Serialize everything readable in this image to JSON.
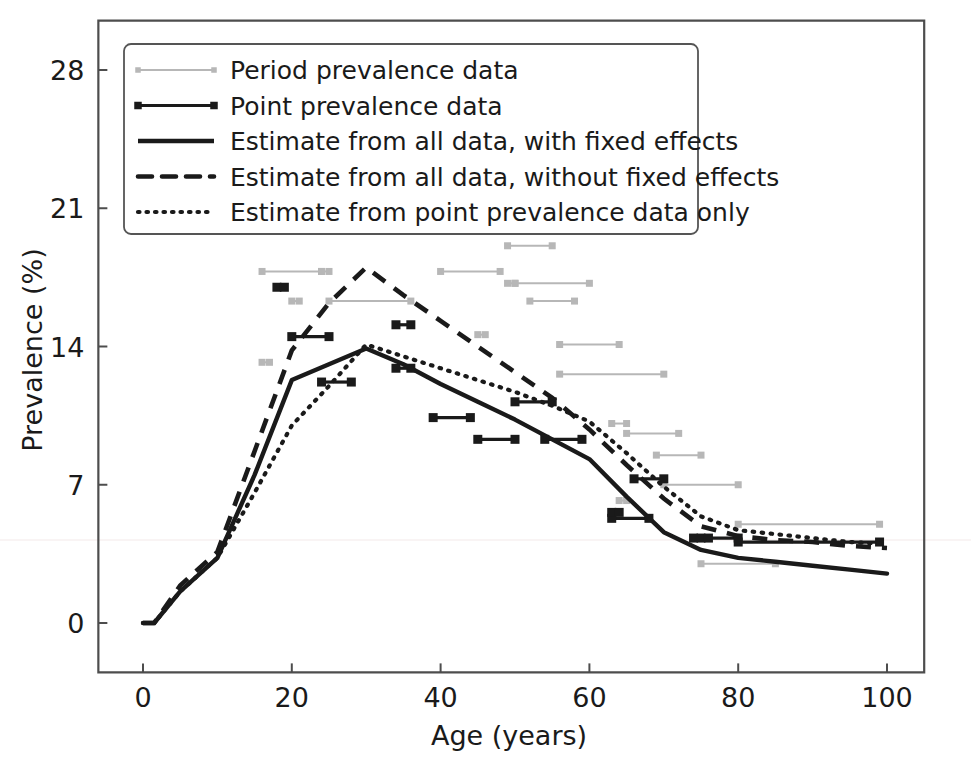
{
  "chart_data": {
    "type": "line",
    "title": "",
    "xlabel": "Age (years)",
    "ylabel": "Prevalence (%)",
    "xlim": [
      -6,
      105
    ],
    "ylim": [
      -2.5,
      30.5
    ],
    "xticks": [
      0,
      20,
      40,
      60,
      80,
      100
    ],
    "yticks": [
      0,
      7,
      14,
      21,
      28
    ],
    "grid": false,
    "legend_position": "upper left",
    "legend_entries": [
      "Period prevalence data",
      "Point prevalence data",
      "Estimate from all data, with fixed effects",
      "Estimate from all data, without fixed effects",
      "Estimate from point prevalence data only"
    ],
    "colors": {
      "estimate": "#1a1a1a",
      "point_data": "#1a1a1a",
      "period_data": "#b7b7b7"
    },
    "series": [
      {
        "name": "Estimate from all data, with fixed effects",
        "style": "solid",
        "x": [
          0,
          1.5,
          5,
          10,
          15,
          20,
          25,
          30,
          35,
          40,
          45,
          50,
          55,
          60,
          65,
          70,
          75,
          80,
          85,
          90,
          95,
          100
        ],
        "y": [
          0.0,
          0.0,
          1.6,
          3.3,
          7.5,
          12.3,
          13.1,
          13.9,
          13.1,
          12.1,
          11.2,
          10.3,
          9.3,
          8.3,
          6.4,
          4.6,
          3.7,
          3.3,
          3.1,
          2.9,
          2.7,
          2.5
        ]
      },
      {
        "name": "Estimate from all data, without fixed effects",
        "style": "dashed",
        "x": [
          0,
          1.5,
          5,
          10,
          15,
          20,
          25,
          30,
          35,
          40,
          45,
          50,
          55,
          60,
          65,
          70,
          75,
          80,
          85,
          90,
          95,
          100
        ],
        "y": [
          0.0,
          0.0,
          1.9,
          3.6,
          8.7,
          13.8,
          16.2,
          18.0,
          16.6,
          15.3,
          14.0,
          12.7,
          11.4,
          9.8,
          8.0,
          6.3,
          4.9,
          4.4,
          4.2,
          4.1,
          3.9,
          3.8
        ]
      },
      {
        "name": "Estimate from point prevalence data only",
        "style": "dotted",
        "x": [
          0,
          1.5,
          5,
          10,
          15,
          20,
          25,
          30,
          35,
          40,
          45,
          50,
          55,
          60,
          65,
          70,
          75,
          80,
          85,
          90,
          95,
          100
        ],
        "y": [
          0.0,
          0.0,
          1.6,
          3.3,
          6.6,
          10.0,
          12.0,
          14.1,
          13.5,
          12.9,
          12.3,
          11.7,
          11.0,
          10.2,
          8.6,
          6.9,
          5.4,
          4.7,
          4.5,
          4.3,
          4.1,
          4.0
        ]
      }
    ],
    "period_prevalence_intervals": [
      {
        "x_start": 16,
        "x_end": 24,
        "y": 17.8
      },
      {
        "x_start": 16,
        "x_end": 17,
        "y": 13.2
      },
      {
        "x_start": 20,
        "x_end": 21,
        "y": 16.3
      },
      {
        "x_start": 24,
        "x_end": 25,
        "y": 17.8
      },
      {
        "x_start": 25,
        "x_end": 36,
        "y": 16.3
      },
      {
        "x_start": 40,
        "x_end": 48,
        "y": 17.8
      },
      {
        "x_start": 45,
        "x_end": 46,
        "y": 14.6
      },
      {
        "x_start": 49,
        "x_end": 55,
        "y": 19.1
      },
      {
        "x_start": 49,
        "x_end": 50,
        "y": 17.2
      },
      {
        "x_start": 50,
        "x_end": 60,
        "y": 17.2
      },
      {
        "x_start": 52,
        "x_end": 58,
        "y": 16.3
      },
      {
        "x_start": 56,
        "x_end": 64,
        "y": 14.1
      },
      {
        "x_start": 56,
        "x_end": 70,
        "y": 12.6
      },
      {
        "x_start": 63,
        "x_end": 65,
        "y": 10.1
      },
      {
        "x_start": 65,
        "x_end": 72,
        "y": 9.6
      },
      {
        "x_start": 69,
        "x_end": 75,
        "y": 8.5
      },
      {
        "x_start": 70,
        "x_end": 80,
        "y": 7.0
      },
      {
        "x_start": 80,
        "x_end": 99,
        "y": 5.0
      },
      {
        "x_start": 75,
        "x_end": 85,
        "y": 3.0
      },
      {
        "x_start": 64,
        "x_end": 65,
        "y": 6.2
      }
    ],
    "point_prevalence_intervals": [
      {
        "x_start": 18,
        "x_end": 19,
        "y": 17.0
      },
      {
        "x_start": 20,
        "x_end": 25,
        "y": 14.5
      },
      {
        "x_start": 24,
        "x_end": 28,
        "y": 12.2
      },
      {
        "x_start": 34,
        "x_end": 36,
        "y": 15.1
      },
      {
        "x_start": 34,
        "x_end": 36,
        "y": 12.9
      },
      {
        "x_start": 39,
        "x_end": 44,
        "y": 10.4
      },
      {
        "x_start": 45,
        "x_end": 50,
        "y": 9.3
      },
      {
        "x_start": 50,
        "x_end": 55,
        "y": 11.2
      },
      {
        "x_start": 54,
        "x_end": 59,
        "y": 9.3
      },
      {
        "x_start": 63,
        "x_end": 68,
        "y": 5.3
      },
      {
        "x_start": 63,
        "x_end": 64,
        "y": 5.6
      },
      {
        "x_start": 66,
        "x_end": 70,
        "y": 7.3
      },
      {
        "x_start": 74,
        "x_end": 80,
        "y": 4.3
      },
      {
        "x_start": 75,
        "x_end": 76,
        "y": 4.3
      },
      {
        "x_start": 80,
        "x_end": 99,
        "y": 4.1
      }
    ]
  }
}
